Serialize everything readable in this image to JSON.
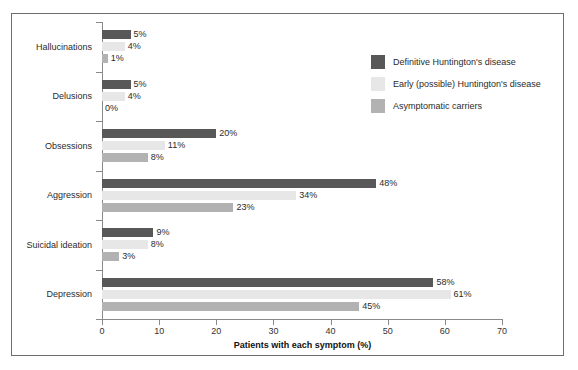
{
  "chart_data": {
    "type": "bar",
    "orientation": "horizontal",
    "title": "",
    "xlabel": "Patients with each symptom (%)",
    "ylabel": "",
    "xlim": [
      0,
      70
    ],
    "xticks": [
      0,
      10,
      20,
      30,
      40,
      50,
      60,
      70
    ],
    "xtick_labels": [
      "0",
      "10",
      "20",
      "30",
      "40",
      "50",
      "60",
      "70"
    ],
    "grid": false,
    "legend_position": "upper right (inside plot)",
    "categories": [
      "Hallucinations",
      "Delusions",
      "Obsessions",
      "Aggression",
      "Suicidal ideation",
      "Depression"
    ],
    "series": [
      {
        "name": "Definitive Huntington's disease",
        "color": "#585858",
        "values": [
          5,
          5,
          20,
          48,
          9,
          58
        ],
        "labels": [
          "5%",
          "5%",
          "20%",
          "48%",
          "9%",
          "58%"
        ]
      },
      {
        "name": "Early (possible) Huntington's disease",
        "color": "#e7e7e7",
        "values": [
          4,
          4,
          11,
          34,
          8,
          61
        ],
        "labels": [
          "4%",
          "4%",
          "11%",
          "34%",
          "8%",
          "61%"
        ]
      },
      {
        "name": "Asymptomatic carriers",
        "color": "#b2b2b2",
        "values": [
          1,
          0,
          8,
          23,
          3,
          45
        ],
        "labels": [
          "1%",
          "0%",
          "8%",
          "23%",
          "3%",
          "45%"
        ]
      }
    ]
  },
  "legend": {
    "items": [
      {
        "label": "Definitive Huntington's disease",
        "color": "#585858"
      },
      {
        "label": "Early (possible) Huntington's disease",
        "color": "#e7e7e7"
      },
      {
        "label": "Asymptomatic carriers",
        "color": "#b2b2b2"
      }
    ]
  },
  "axes": {
    "x_title": "Patients with each symptom (%)",
    "x_tick_labels": [
      "0",
      "10",
      "20",
      "30",
      "40",
      "50",
      "60",
      "70"
    ],
    "y_tick_labels": [
      "Hallucinations",
      "Delusions",
      "Obsessions",
      "Aggression",
      "Suicidal ideation",
      "Depression"
    ]
  }
}
